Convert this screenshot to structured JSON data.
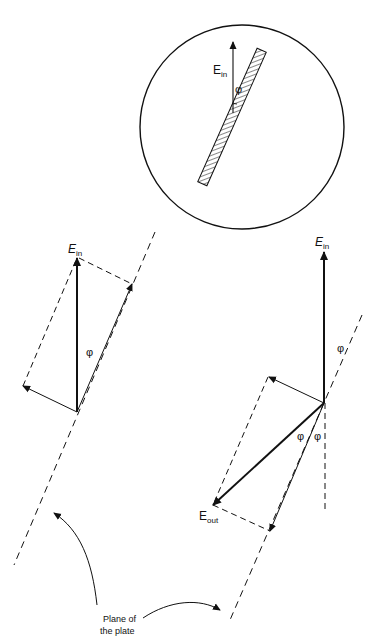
{
  "figure": {
    "header_fragment": "",
    "inset": {
      "field_label": "E",
      "field_subscript": "in",
      "angle_label": "φ"
    },
    "left_panel": {
      "field_label": "E",
      "field_subscript": "in",
      "angle_label": "φ"
    },
    "right_panel": {
      "input_label": "E",
      "input_subscript": "in",
      "output_label": "E",
      "output_subscript": "out",
      "angle_label_top": "φ",
      "angle_label_left": "φ",
      "angle_label_right": "φ"
    },
    "caption": {
      "line1": "Plane of",
      "line2": "the plate"
    }
  }
}
